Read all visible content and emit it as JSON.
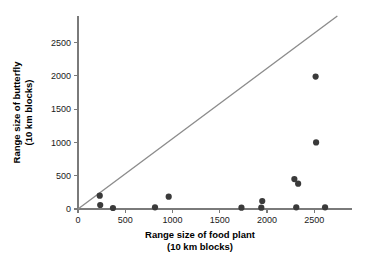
{
  "chart_data": {
    "type": "scatter",
    "title": "",
    "xlabel": "Range size of food plant",
    "xlabel_line2": "(10 km blocks)",
    "ylabel": "Range size of butterfly",
    "ylabel_line2": "(10 km blocks)",
    "xlim": [
      0,
      2900
    ],
    "ylim": [
      0,
      2900
    ],
    "xticks": [
      0,
      500,
      1000,
      1500,
      2000,
      2500
    ],
    "yticks": [
      0,
      500,
      1000,
      1500,
      2000,
      2500
    ],
    "xticklabels": [
      "0",
      "500",
      "1000",
      "1500",
      "2000",
      "2500"
    ],
    "yticklabels": [
      "0",
      "500",
      "1000",
      "1500",
      "2000",
      "2500"
    ],
    "grid": false,
    "legend": null,
    "point_color": "#3a3a3a",
    "line_color": "#8c8c8c",
    "axis_color": "#7a7a7a",
    "points": [
      {
        "x": 230,
        "y": 200
      },
      {
        "x": 235,
        "y": 60
      },
      {
        "x": 370,
        "y": 15
      },
      {
        "x": 815,
        "y": 25
      },
      {
        "x": 960,
        "y": 185
      },
      {
        "x": 1730,
        "y": 20
      },
      {
        "x": 1940,
        "y": 20
      },
      {
        "x": 1950,
        "y": 120
      },
      {
        "x": 2290,
        "y": 450
      },
      {
        "x": 2330,
        "y": 380
      },
      {
        "x": 2310,
        "y": 25
      },
      {
        "x": 2515,
        "y": 1990
      },
      {
        "x": 2520,
        "y": 1000
      },
      {
        "x": 2615,
        "y": 25
      }
    ],
    "reference_line": {
      "description": "1:1 diagonal reference line",
      "x0": 0,
      "y0": 0,
      "x1": 2745,
      "y1": 2900
    }
  }
}
